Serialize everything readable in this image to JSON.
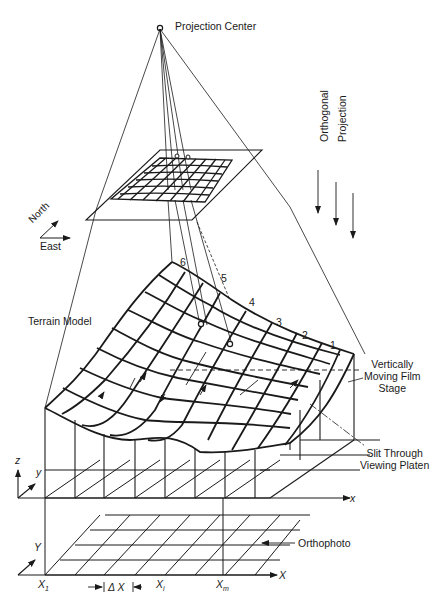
{
  "figure": {
    "labels": {
      "projection_center": "Projection Center",
      "orthogonal": "Orthogonal",
      "projection": "Projection",
      "north": "North",
      "east": "East",
      "terrain_model": "Terrain Model",
      "vertically_moving_film_stage": [
        "Vertically",
        "Moving Film",
        "Stage"
      ],
      "slit_through_viewing_platen": [
        "Slit Through",
        "Viewing Platen"
      ],
      "orthophoto": "Orthophoto"
    },
    "profile_numbers": [
      "6",
      "5",
      "4",
      "3",
      "2",
      "1"
    ],
    "axes": {
      "model_z": "z",
      "model_y": "y",
      "model_x": "x",
      "ortho_Y": "Y",
      "ortho_X": "X",
      "x1": "X",
      "x1_sub": "1",
      "delta_x": "Δ X",
      "xi": "X",
      "xi_sub": "i",
      "xm": "X",
      "xm_sub": "m"
    },
    "colors": {
      "line": "#1a1a1a",
      "background": "#ffffff"
    }
  }
}
